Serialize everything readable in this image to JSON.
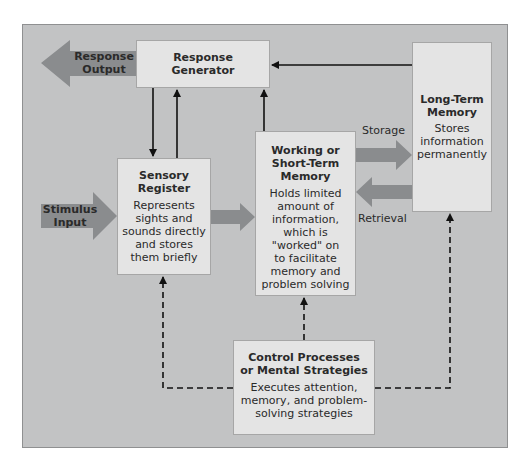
{
  "colors": {
    "panel": "#c2c3c4",
    "box": "#e4e4e4",
    "big_arrow": "#8a8c8e",
    "line": "#111111"
  },
  "inputs": {
    "stimulus": {
      "line1": "Stimulus",
      "line2": "Input"
    }
  },
  "outputs": {
    "response": {
      "line1": "Response",
      "line2": "Output"
    }
  },
  "boxes": {
    "response_generator": {
      "title1": "Response",
      "title2": "Generator"
    },
    "sensory_register": {
      "title1": "Sensory",
      "title2": "Register",
      "desc": [
        "Represents",
        "sights and",
        "sounds directly",
        "and stores",
        "them briefly"
      ]
    },
    "working_memory": {
      "title1": "Working or",
      "title2": "Short-Term",
      "title3": "Memory",
      "desc": [
        "Holds limited",
        "amount of",
        "information,",
        "which is",
        "\"worked\" on",
        "to facilitate",
        "memory and",
        "problem solving"
      ]
    },
    "long_term_memory": {
      "title1": "Long-Term",
      "title2": "Memory",
      "desc": [
        "Stores",
        "information",
        "permanently"
      ]
    },
    "control_processes": {
      "title1": "Control Processes",
      "title2": "or Mental Strategies",
      "desc": [
        "Executes attention,",
        "memory, and problem-",
        "solving strategies"
      ]
    }
  },
  "flows": {
    "storage": "Storage",
    "retrieval": "Retrieval"
  }
}
